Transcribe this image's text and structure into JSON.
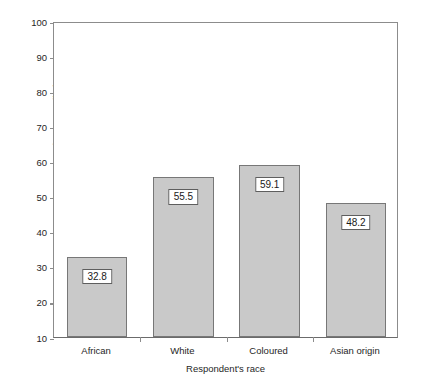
{
  "chart_data": {
    "type": "bar",
    "title": "",
    "subtitle": "",
    "xlabel": "Respondent's race",
    "ylabel": "Percentage at least somewhat reconciled",
    "categories": [
      "African",
      "White",
      "Coloured",
      "Asian origin"
    ],
    "values": [
      32.8,
      55.5,
      59.1,
      48.2
    ],
    "value_labels": [
      "32.8",
      "55.5",
      "59.1",
      "48.2"
    ],
    "ylim": [
      10,
      100
    ],
    "yticks": [
      10,
      20,
      30,
      40,
      50,
      60,
      70,
      80,
      90,
      100
    ],
    "ytick_labels": [
      "10",
      "20",
      "30",
      "40",
      "50",
      "60",
      "70",
      "80",
      "90",
      "100"
    ],
    "grid": false,
    "legend": null,
    "legend_position": "none",
    "bar_fill_color": "#c9c9c9",
    "bar_edge_color": "#777777",
    "axis_color": "#8c8c8c",
    "background_color": "#ffffff"
  }
}
